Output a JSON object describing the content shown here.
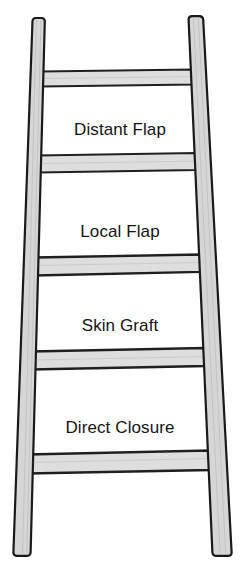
{
  "diagram": {
    "type": "reconstructive-ladder",
    "background_color": "#ffffff",
    "rail_fill_color": "#d6d6d6",
    "rung_fill_color": "#e3e3e3",
    "outline_color": "#1a1a1a",
    "label_color": "#141414",
    "rungs": [
      {
        "id": "rung-5",
        "label": "",
        "y_top": 71,
        "y_bottom": 86,
        "has_label": false
      },
      {
        "id": "rung-4",
        "label": "Distant Flap",
        "y_top": 155,
        "y_bottom": 172,
        "has_label": true,
        "label_y": 128
      },
      {
        "id": "rung-3",
        "label": "Local Flap",
        "y_top": 257,
        "y_bottom": 275,
        "has_label": true,
        "label_y": 230
      },
      {
        "id": "rung-2",
        "label": "Skin Graft",
        "y_top": 351,
        "y_bottom": 369,
        "has_label": true,
        "label_y": 324
      },
      {
        "id": "rung-1",
        "label": "Direct Closure",
        "y_top": 454,
        "y_bottom": 473,
        "has_label": true,
        "label_y": 426
      }
    ],
    "labels": [
      "Distant Flap",
      "Local Flap",
      "Skin Graft",
      "Direct Closure"
    ],
    "left_rail": {
      "name": "left-rail",
      "top_x_outer": 31,
      "top_x_inner": 45,
      "bottom_x_outer": 13,
      "bottom_x_inner": 30,
      "y_top": 18,
      "y_bottom": 556
    },
    "right_rail": {
      "name": "right-rail",
      "top_x_inner": 188,
      "top_x_outer": 203,
      "bottom_x_inner": 212,
      "bottom_x_outer": 232,
      "y_top": 16,
      "y_bottom": 556
    }
  }
}
